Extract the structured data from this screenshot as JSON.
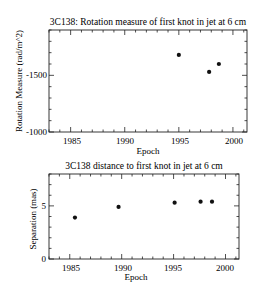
{
  "chart_data": [
    {
      "type": "scatter",
      "title": "3C138: Rotation measure of first knot in jet at 6 cm",
      "xlabel": "Epoch",
      "ylabel": "Rotation Measure (rad/m^2)",
      "xlim": [
        1983,
        2001.3
      ],
      "ylim": [
        -1000,
        -1900
      ],
      "y_inverted": true,
      "xticks": [
        1985,
        1990,
        1995,
        2000
      ],
      "yticks": [
        -1500,
        -1000
      ],
      "grid": false,
      "legend": null,
      "x": [
        1995.0,
        1997.8,
        1998.7
      ],
      "y": [
        -1680,
        -1530,
        -1600
      ]
    },
    {
      "type": "scatter",
      "title": "3C138 distance to first knot in jet at 6 cm",
      "xlabel": "Epoch",
      "ylabel": "Separation (mas)",
      "xlim": [
        1983,
        2001.3
      ],
      "ylim": [
        0,
        8
      ],
      "xticks": [
        1985,
        1990,
        1995,
        2000
      ],
      "yticks": [
        0,
        5
      ],
      "grid": false,
      "legend": null,
      "x": [
        1985.5,
        1989.7,
        1995.1,
        1997.6,
        1998.7
      ],
      "y": [
        3.9,
        4.9,
        5.3,
        5.4,
        5.4
      ]
    }
  ],
  "plots": {
    "top": {
      "title": "3C138: Rotation measure of first knot in jet at 6 cm",
      "xlabel": "Epoch",
      "ylabel": "Rotation Measure (rad/m^2)",
      "xtick_labels": [
        "1985",
        "1990",
        "1995",
        "2000"
      ],
      "ytick_labels": [
        "-1500",
        "-1000"
      ]
    },
    "bottom": {
      "title": "3C138 distance to first knot in jet at 6 cm",
      "xlabel": "Epoch",
      "ylabel": "Separation (mas)",
      "xtick_labels": [
        "1985",
        "1990",
        "1995",
        "2000"
      ],
      "ytick_labels": [
        "5",
        "0"
      ]
    }
  }
}
